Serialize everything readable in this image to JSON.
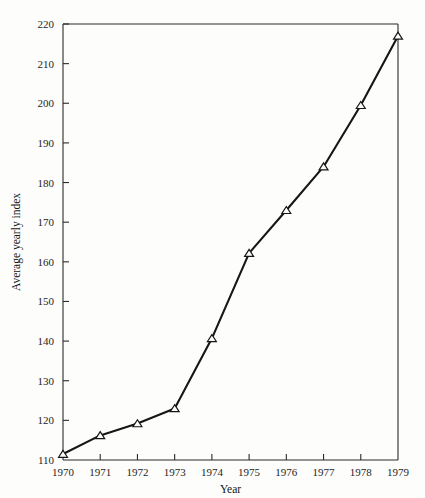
{
  "chart_data": {
    "type": "line",
    "title": "",
    "xlabel": "Year",
    "ylabel": "Average yearly index",
    "x": [
      1970,
      1971,
      1972,
      1973,
      1974,
      1975,
      1976,
      1977,
      1978,
      1979
    ],
    "categories": [
      "1970",
      "1971",
      "1972",
      "1973",
      "1974",
      "1975",
      "1976",
      "1977",
      "1978",
      "1979"
    ],
    "values": [
      111.5,
      116.2,
      119.2,
      123.0,
      140.7,
      162.2,
      173.0,
      184.0,
      199.5,
      217.0
    ],
    "series": [
      {
        "name": "Average yearly index",
        "values": [
          111.5,
          116.2,
          119.2,
          123.0,
          140.7,
          162.2,
          173.0,
          184.0,
          199.5,
          217.0
        ]
      }
    ],
    "xlim": [
      1970,
      1979
    ],
    "ylim": [
      110,
      220
    ],
    "ytick_labels": [
      "110",
      "120",
      "130",
      "140",
      "150",
      "160",
      "170",
      "180",
      "190",
      "200",
      "210",
      "220"
    ],
    "ytick_values": [
      110,
      120,
      130,
      140,
      150,
      160,
      170,
      180,
      190,
      200,
      210,
      220
    ],
    "xtick_labels": [
      "1970",
      "1971",
      "1972",
      "1973",
      "1974",
      "1975",
      "1976",
      "1977",
      "1978",
      "1979"
    ],
    "grid": false,
    "legend": "none",
    "marker": "triangle-up",
    "line_color": "#161616",
    "axis_color": "#2b2b2b",
    "background_color": "#fdfdfb"
  }
}
